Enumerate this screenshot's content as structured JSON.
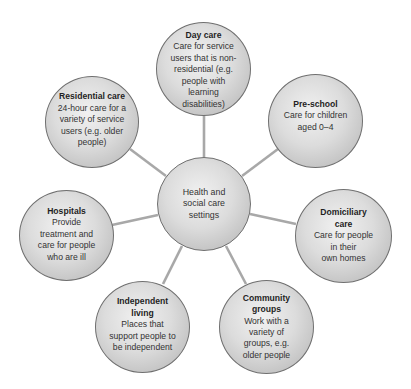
{
  "diagram": {
    "center": {
      "label": "Health and social care settings",
      "lines": [
        "Health and",
        "social care",
        "settings"
      ]
    },
    "nodes": [
      {
        "id": "day-care",
        "title": "Day care",
        "description": "Care for service users that is non-residential (e.g. people with learning disabilities)",
        "lines": [
          "Care for service",
          "users that is non-",
          "residential (e.g.",
          "people with",
          "learning",
          "disabilities)"
        ]
      },
      {
        "id": "pre-school",
        "title": "Pre-school",
        "description": "Care for children aged 0–4",
        "lines": [
          "Care for children",
          "aged 0–4"
        ]
      },
      {
        "id": "domiciliary-care",
        "title_lines": [
          "Domiciliary",
          "care"
        ],
        "title": "Domiciliary care",
        "description": "Care for people in their own homes",
        "lines": [
          "Care for people",
          "in their",
          "own homes"
        ]
      },
      {
        "id": "community-groups",
        "title_lines": [
          "Community",
          "groups"
        ],
        "title": "Community groups",
        "description": "Work with a variety of groups, e.g. older people",
        "lines": [
          "Work with a",
          "variety of",
          "groups, e.g.",
          "older people"
        ]
      },
      {
        "id": "independent-living",
        "title_lines": [
          "Independent",
          "living"
        ],
        "title": "Independent living",
        "description": "Places that support people to be independent",
        "lines": [
          "Places that",
          "support people to",
          "be independent"
        ]
      },
      {
        "id": "hospitals",
        "title": "Hospitals",
        "description": "Provide treatment and care for people who are ill",
        "lines": [
          "Provide",
          "treatment and",
          "care for people",
          "who are ill"
        ]
      },
      {
        "id": "residential-care",
        "title": "Residential care",
        "description": "24-hour care for a variety of service users (e.g. older people)",
        "lines": [
          "24-hour care for a",
          "variety of service",
          "users (e.g. older",
          "people)"
        ]
      }
    ],
    "colors": {
      "connector": "#a8a8a8",
      "node_border": "#6f6f6f",
      "node_fill_light": "#f1f1f1",
      "node_fill_dark": "#a9a9a9",
      "text": "#2a2a2a"
    }
  }
}
